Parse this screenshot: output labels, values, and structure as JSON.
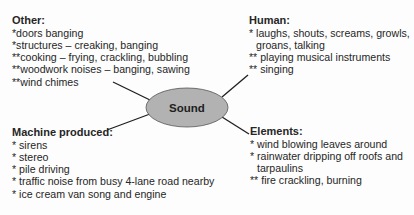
{
  "center": {
    "label": "Sound",
    "fill": "#b2b2b2"
  },
  "categories": {
    "other": {
      "heading": "Other:",
      "items": [
        "*doors banging",
        "*structures – creaking, banging",
        "**cooking – frying, crackling, bubbling",
        "**woodwork noises – banging, sawing",
        "**wind chimes"
      ]
    },
    "human": {
      "heading": "Human:",
      "items": [
        {
          "first": "* laughs, shouts, screams, growls,",
          "cont": "groans, talking"
        },
        {
          "first": "** playing musical instruments"
        },
        {
          "first": "** singing"
        }
      ]
    },
    "machine": {
      "heading": "Machine produced:",
      "items": [
        "* sirens",
        "* stereo",
        "* pile driving",
        "* traffic noise from busy 4-lane road nearby",
        "* ice cream van song and engine"
      ]
    },
    "elements": {
      "heading": "Elements:",
      "items": [
        {
          "first": "* wind blowing leaves around"
        },
        {
          "first": "* rainwater dripping off roofs and",
          "cont": "tarpaulins"
        },
        {
          "first": "** fire crackling, burning"
        }
      ]
    }
  }
}
